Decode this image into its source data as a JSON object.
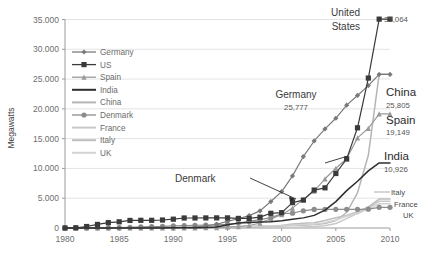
{
  "chart_data": {
    "type": "line",
    "title": "",
    "xlabel": "",
    "ylabel": "Megawatts",
    "xlim": [
      1980,
      2010
    ],
    "ylim": [
      0,
      35000
    ],
    "grid": true,
    "legend_position": "inside-top-left",
    "ytick_labels": [
      "0",
      "5.000",
      "10.000",
      "15.000",
      "20.000",
      "25.000",
      "30.000",
      "35.000"
    ],
    "ytick_values": [
      0,
      5000,
      10000,
      15000,
      20000,
      25000,
      30000,
      35000
    ],
    "xtick_labels": [
      "1980",
      "1985",
      "1990",
      "1995",
      "2000",
      "2005",
      "2010"
    ],
    "xtick_values": [
      1980,
      1985,
      1990,
      1995,
      2000,
      2005,
      2010
    ],
    "x": [
      1980,
      1981,
      1982,
      1983,
      1984,
      1985,
      1986,
      1987,
      1988,
      1989,
      1990,
      1991,
      1992,
      1993,
      1994,
      1995,
      1996,
      1997,
      1998,
      1999,
      2000,
      2001,
      2002,
      2003,
      2004,
      2005,
      2006,
      2007,
      2008,
      2009,
      2010
    ],
    "series": [
      {
        "name": "Germany",
        "marker": "diamond",
        "color": "#7a7a7a",
        "values": [
          0,
          0,
          0,
          0,
          5,
          10,
          20,
          30,
          50,
          90,
          60,
          110,
          180,
          330,
          630,
          1120,
          1550,
          2080,
          2870,
          4440,
          6110,
          8750,
          11990,
          14610,
          16630,
          18420,
          20620,
          22250,
          23900,
          25777,
          25777
        ]
      },
      {
        "name": "US",
        "marker": "square",
        "color": "#3a3a3a",
        "values": [
          10,
          40,
          250,
          600,
          900,
          1040,
          1270,
          1290,
          1290,
          1340,
          1480,
          1680,
          1680,
          1690,
          1700,
          1700,
          1610,
          1610,
          1820,
          2470,
          2580,
          4260,
          4680,
          6370,
          6740,
          9149,
          11603,
          16819,
          25170,
          35064,
          35064
        ]
      },
      {
        "name": "Spain",
        "marker": "triangle",
        "color": "#9a9a9a",
        "values": [
          0,
          0,
          0,
          0,
          0,
          0,
          0,
          0,
          0,
          0,
          7,
          10,
          30,
          50,
          70,
          140,
          230,
          420,
          830,
          1530,
          2240,
          3340,
          4830,
          6200,
          8260,
          10030,
          11620,
          15130,
          16740,
          19149,
          19149
        ]
      },
      {
        "name": "India",
        "marker": "none",
        "color": "#2e2e2e",
        "values": [
          0,
          0,
          0,
          0,
          0,
          0,
          0,
          0,
          0,
          10,
          30,
          40,
          50,
          80,
          180,
          560,
          820,
          940,
          990,
          1040,
          1220,
          1460,
          1700,
          2120,
          3000,
          4430,
          6270,
          7850,
          9587,
          10926,
          10926
        ]
      },
      {
        "name": "China",
        "marker": "none",
        "color": "#b5b5b5",
        "values": [
          0,
          0,
          0,
          0,
          0,
          0,
          0,
          0,
          0,
          0,
          10,
          10,
          20,
          20,
          30,
          40,
          60,
          150,
          220,
          270,
          340,
          400,
          470,
          570,
          760,
          1260,
          2600,
          5910,
          12210,
          25805,
          25805
        ]
      },
      {
        "name": "Denmark",
        "marker": "circle",
        "color": "#8c8c8c",
        "values": [
          5,
          10,
          20,
          30,
          50,
          80,
          120,
          180,
          220,
          260,
          340,
          410,
          460,
          490,
          540,
          610,
          820,
          1110,
          1420,
          1740,
          2390,
          2490,
          2890,
          3120,
          3120,
          3130,
          3140,
          3130,
          3160,
          3465,
          3465
        ]
      },
      {
        "name": "France",
        "marker": "none",
        "color": "#c9c9c9",
        "values": [
          0,
          0,
          0,
          0,
          0,
          0,
          0,
          0,
          0,
          0,
          0,
          0,
          0,
          0,
          0,
          5,
          10,
          10,
          20,
          25,
          70,
          90,
          150,
          240,
          390,
          760,
          1570,
          2470,
          3400,
          4492,
          4492
        ]
      },
      {
        "name": "Italy",
        "marker": "none",
        "color": "#bfbfbf",
        "values": [
          0,
          0,
          0,
          0,
          0,
          0,
          0,
          0,
          0,
          0,
          0,
          0,
          0,
          5,
          20,
          30,
          70,
          100,
          180,
          280,
          430,
          680,
          790,
          900,
          1260,
          1720,
          2120,
          2730,
          3540,
          4850,
          4850
        ]
      },
      {
        "name": "UK",
        "marker": "none",
        "color": "#d2d2d2",
        "values": [
          0,
          0,
          0,
          0,
          0,
          0,
          0,
          0,
          0,
          5,
          10,
          20,
          40,
          120,
          170,
          200,
          260,
          330,
          340,
          360,
          410,
          480,
          550,
          650,
          890,
          1350,
          1960,
          2390,
          3240,
          4051,
          4051
        ]
      }
    ],
    "annotations": [
      {
        "id": "united-states",
        "label": "United States",
        "value": "35,064",
        "series": "US"
      },
      {
        "id": "germany",
        "label": "Germany",
        "value": "25,777",
        "series": "Germany"
      },
      {
        "id": "china",
        "label": "China",
        "value": "25,805",
        "series": "China"
      },
      {
        "id": "spain",
        "label": "Spain",
        "value": "19,149",
        "series": "Spain"
      },
      {
        "id": "india",
        "label": "India",
        "value": "10,926",
        "series": "India"
      },
      {
        "id": "italy",
        "label": "Italy",
        "value": "",
        "series": "Italy"
      },
      {
        "id": "france",
        "label": "France",
        "value": "",
        "series": "France"
      },
      {
        "id": "uk",
        "label": "UK",
        "value": "",
        "series": "UK"
      },
      {
        "id": "denmark",
        "label": "Denmark",
        "value": "",
        "series": "Denmark"
      }
    ]
  },
  "legend": {
    "items": [
      {
        "label": "Germany"
      },
      {
        "label": "US"
      },
      {
        "label": "Spain"
      },
      {
        "label": "India"
      },
      {
        "label": "China"
      },
      {
        "label": "Denmark"
      },
      {
        "label": "France"
      },
      {
        "label": "Italy"
      },
      {
        "label": "UK"
      }
    ]
  },
  "axes": {
    "y_title": "Megawatts"
  }
}
